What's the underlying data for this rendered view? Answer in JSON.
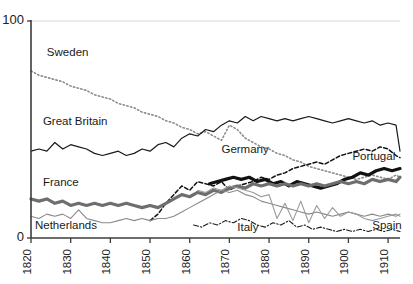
{
  "chart_data": {
    "type": "line",
    "title": "",
    "subtitle": "",
    "xlabel": "",
    "ylabel": "",
    "xlim": [
      1820,
      1913
    ],
    "ylim": [
      0,
      100
    ],
    "grid": "single horizontal gridline at y=100",
    "legend_position": "inline labels next to lines",
    "xticks": [
      1820,
      1830,
      1840,
      1850,
      1860,
      1870,
      1880,
      1890,
      1900,
      1910
    ],
    "xtick_labels": [
      "1820",
      "1830",
      "1840",
      "1850",
      "1860",
      "1870",
      "1880",
      "1890",
      "1900",
      "1910"
    ],
    "yticks": [
      0,
      100
    ],
    "ytick_labels": [
      "0",
      "100"
    ],
    "series": [
      {
        "name": "Sweden",
        "label": "Sweden",
        "style": "dotted",
        "color": "#8c8c8c",
        "width": 1.6,
        "label_x": 1824,
        "label_y": 84,
        "x": [
          1820,
          1822,
          1824,
          1826,
          1828,
          1830,
          1832,
          1834,
          1836,
          1838,
          1840,
          1842,
          1844,
          1846,
          1848,
          1850,
          1852,
          1854,
          1856,
          1858,
          1860,
          1862,
          1864,
          1866,
          1868,
          1870,
          1872,
          1874,
          1876,
          1878,
          1880,
          1882,
          1884,
          1886,
          1888,
          1890,
          1892,
          1894,
          1896,
          1898,
          1900,
          1902,
          1904,
          1906,
          1908,
          1910,
          1912,
          1913
        ],
        "y": [
          77,
          75,
          74,
          73,
          72,
          70,
          69,
          68,
          66,
          65,
          64,
          62,
          61,
          60,
          58,
          57,
          56,
          54,
          53,
          51,
          50,
          48,
          49,
          47,
          45,
          52,
          50,
          46,
          44,
          42,
          41,
          39,
          38,
          36,
          35,
          33,
          32,
          31,
          30,
          29,
          28,
          27,
          28,
          29,
          28,
          27,
          29,
          28
        ]
      },
      {
        "name": "Great Britain",
        "label": "Great Britain",
        "style": "solid",
        "color": "#1a1a1a",
        "width": 1.2,
        "label_x": 1823,
        "label_y": 52,
        "x": [
          1820,
          1822,
          1824,
          1826,
          1828,
          1830,
          1832,
          1834,
          1836,
          1838,
          1840,
          1842,
          1844,
          1846,
          1848,
          1850,
          1852,
          1854,
          1856,
          1858,
          1860,
          1862,
          1864,
          1866,
          1868,
          1870,
          1872,
          1874,
          1876,
          1878,
          1880,
          1882,
          1884,
          1886,
          1888,
          1890,
          1892,
          1894,
          1896,
          1898,
          1900,
          1902,
          1904,
          1906,
          1908,
          1910,
          1912,
          1913
        ],
        "y": [
          40,
          41,
          40,
          44,
          41,
          43,
          42,
          41,
          39,
          38,
          39,
          40,
          38,
          39,
          41,
          40,
          43,
          44,
          42,
          46,
          48,
          47,
          50,
          49,
          52,
          54,
          53,
          56,
          54,
          56,
          55,
          54,
          55,
          54,
          55,
          56,
          55,
          54,
          53,
          54,
          55,
          54,
          53,
          54,
          52,
          53,
          52,
          40
        ]
      },
      {
        "name": "Germany",
        "label": "Germany",
        "style": "dashed",
        "color": "#111111",
        "width": 1.5,
        "label_x": 1868,
        "label_y": 39,
        "x": [
          1850,
          1852,
          1854,
          1856,
          1858,
          1860,
          1862,
          1864,
          1866,
          1868,
          1870,
          1872,
          1874,
          1876,
          1878,
          1880,
          1882,
          1884,
          1886,
          1888,
          1890,
          1892,
          1894,
          1896,
          1898,
          1900,
          1902,
          1904,
          1906,
          1908,
          1910,
          1912,
          1913
        ],
        "y": [
          8,
          11,
          16,
          20,
          24,
          22,
          26,
          25,
          24,
          26,
          22,
          24,
          25,
          26,
          28,
          27,
          29,
          30,
          32,
          33,
          34,
          35,
          34,
          36,
          38,
          39,
          40,
          41,
          40,
          42,
          41,
          38,
          37
        ]
      },
      {
        "name": "Portugal",
        "label": "Portugal",
        "style": "solid",
        "color": "#111111",
        "width": 3.2,
        "label_x": 1901,
        "label_y": 36,
        "x": [
          1865,
          1867,
          1869,
          1871,
          1873,
          1875,
          1877,
          1879,
          1881,
          1883,
          1885,
          1887,
          1889,
          1891,
          1893,
          1895,
          1897,
          1899,
          1901,
          1903,
          1905,
          1907,
          1909,
          1911,
          1913
        ],
        "y": [
          25,
          26,
          27,
          28,
          27,
          28,
          26,
          27,
          25,
          26,
          24,
          26,
          25,
          24,
          23,
          24,
          25,
          27,
          28,
          30,
          29,
          31,
          32,
          31,
          32
        ]
      },
      {
        "name": "France",
        "label": "France",
        "style": "solid",
        "color": "#6e6e6e",
        "width": 3.2,
        "label_x": 1823,
        "label_y": 24,
        "x": [
          1820,
          1822,
          1824,
          1826,
          1828,
          1830,
          1832,
          1834,
          1836,
          1838,
          1840,
          1842,
          1844,
          1846,
          1848,
          1850,
          1852,
          1854,
          1856,
          1858,
          1860,
          1862,
          1864,
          1866,
          1868,
          1870,
          1872,
          1874,
          1876,
          1878,
          1880,
          1882,
          1884,
          1886,
          1888,
          1890,
          1892,
          1894,
          1896,
          1898,
          1900,
          1902,
          1904,
          1906,
          1908,
          1910,
          1912,
          1913
        ],
        "y": [
          18,
          17,
          18,
          16,
          17,
          15,
          16,
          15,
          16,
          15,
          16,
          15,
          16,
          15,
          14,
          15,
          14,
          16,
          18,
          20,
          19,
          21,
          20,
          22,
          21,
          23,
          24,
          23,
          25,
          24,
          25,
          24,
          25,
          24,
          25,
          24,
          25,
          24,
          25,
          26,
          25,
          26,
          25,
          27,
          26,
          27,
          26,
          28
        ]
      },
      {
        "name": "Netherlands",
        "label": "Netherlands",
        "style": "solid",
        "color": "#8a8a8a",
        "width": 1.1,
        "label_x": 1821,
        "label_y": 4,
        "x": [
          1820,
          1822,
          1824,
          1826,
          1828,
          1830,
          1832,
          1834,
          1836,
          1838,
          1840,
          1842,
          1844,
          1846,
          1848,
          1850,
          1852,
          1854,
          1856,
          1858,
          1860,
          1862,
          1864,
          1866,
          1868,
          1870,
          1872,
          1874,
          1876,
          1878,
          1880,
          1882,
          1884,
          1886,
          1888,
          1890,
          1892,
          1894,
          1896,
          1898,
          1900,
          1902,
          1904,
          1906,
          1908,
          1910,
          1912,
          1913
        ],
        "y": [
          10,
          9,
          11,
          10,
          11,
          9,
          13,
          9,
          8,
          7,
          7,
          8,
          9,
          8,
          9,
          8,
          9,
          9,
          10,
          12,
          14,
          16,
          18,
          20,
          22,
          21,
          22,
          20,
          19,
          17,
          16,
          15,
          14,
          13,
          12,
          11,
          12,
          11,
          10,
          11,
          12,
          11,
          10,
          11,
          10,
          11,
          10,
          11
        ]
      },
      {
        "name": "Spain",
        "label": "Spain",
        "style": "solid",
        "color": "#9a9a9a",
        "width": 1.1,
        "label_x": 1906,
        "label_y": 4,
        "x": [
          1862,
          1864,
          1866,
          1868,
          1870,
          1872,
          1874,
          1876,
          1878,
          1880,
          1882,
          1884,
          1886,
          1888,
          1890,
          1892,
          1894,
          1896,
          1898,
          1900,
          1902,
          1904,
          1906,
          1908,
          1910,
          1912,
          1913
        ],
        "y": [
          22,
          21,
          23,
          22,
          24,
          23,
          22,
          21,
          19,
          20,
          9,
          16,
          8,
          17,
          7,
          15,
          9,
          14,
          10,
          12,
          11,
          9,
          8,
          9,
          10,
          11,
          10
        ]
      },
      {
        "name": "Italy",
        "label": "Italy",
        "style": "dashdot",
        "color": "#1a1a1a",
        "width": 1.1,
        "label_x": 1872,
        "label_y": 3,
        "x": [
          1861,
          1863,
          1865,
          1867,
          1869,
          1871,
          1873,
          1875,
          1877,
          1879,
          1881,
          1883,
          1885,
          1887,
          1889,
          1891,
          1893,
          1895,
          1897,
          1899,
          1901,
          1903,
          1905,
          1907,
          1909,
          1911,
          1913
        ],
        "y": [
          6,
          5,
          7,
          6,
          8,
          7,
          9,
          8,
          6,
          5,
          7,
          6,
          8,
          5,
          6,
          4,
          5,
          4,
          3,
          4,
          3,
          4,
          3,
          4,
          3,
          4,
          3
        ]
      }
    ]
  }
}
